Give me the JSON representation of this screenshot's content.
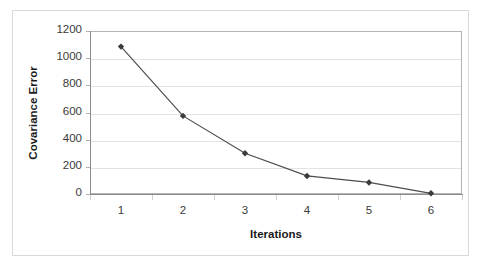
{
  "chart_data": {
    "type": "line",
    "title": "",
    "subtitle": "",
    "xlabel": "Iterations",
    "ylabel": "Covariance Error",
    "categories": [
      "1",
      "2",
      "3",
      "4",
      "5",
      "6"
    ],
    "values": [
      1085,
      575,
      300,
      133,
      85,
      5
    ],
    "series": [
      {
        "name": "Covariance Error",
        "values": [
          1085,
          575,
          300,
          133,
          85,
          5
        ]
      }
    ],
    "ylim": [
      0,
      1200
    ],
    "ytick_values": [
      0,
      200,
      400,
      600,
      800,
      1000,
      1200
    ],
    "ytick_labels": [
      "0",
      "200",
      "400",
      "600",
      "800",
      "1000",
      "1200"
    ],
    "xtick_labels": [
      "1",
      "2",
      "3",
      "4",
      "5",
      "6"
    ],
    "grid": "horizontal",
    "legend": "none",
    "marker": "diamond",
    "colors": {
      "line": "#4d4d4d",
      "marker": "#3b3b3b",
      "gridline": "#e3e3e3",
      "axis": "#8c8c8c",
      "plot_border": "#b3b3b3",
      "outer_frame": "#d9d9d9",
      "background": "#ffffff",
      "tick_label": "#3a3a3a",
      "axis_title": "#1a1a1a"
    }
  }
}
